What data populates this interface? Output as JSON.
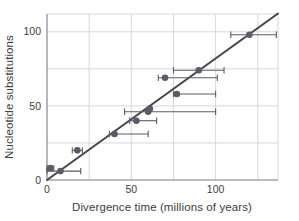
{
  "chart_data": {
    "type": "scatter",
    "title": "",
    "xlabel": "Divergence time (millions of years)",
    "ylabel": "Nucleotide substitutions",
    "xlim": [
      0,
      137
    ],
    "ylim": [
      0,
      112
    ],
    "xticks": [
      0,
      50,
      100
    ],
    "xticklabels": [
      "0",
      "50",
      "100"
    ],
    "yticks": [
      0,
      50,
      100
    ],
    "yticklabels": [
      "0",
      "50",
      "100"
    ],
    "grid": true,
    "gridlines_x": [
      0,
      25,
      50,
      75,
      100,
      125
    ],
    "gridlines_y": [
      0,
      25,
      50,
      75,
      100
    ],
    "legend": "none",
    "marker_color": "#5b5b66",
    "line_color": "#46464f",
    "grid_color": "#d4d4da",
    "axis_color": "#8a8a92",
    "errorbar_color": "#5b5b66",
    "points": [
      {
        "x": 2,
        "y": 8,
        "xerr_low": 2,
        "xerr_high": 2
      },
      {
        "x": 8,
        "y": 6,
        "xerr_low": 8,
        "xerr_high": 12
      },
      {
        "x": 18,
        "y": 20,
        "xerr_low": 3,
        "xerr_high": 3
      },
      {
        "x": 40,
        "y": 31,
        "xerr_low": 3,
        "xerr_high": 20
      },
      {
        "x": 53,
        "y": 40,
        "xerr_low": 4,
        "xerr_high": 12
      },
      {
        "x": 60,
        "y": 46,
        "xerr_low": 14,
        "xerr_high": 40
      },
      {
        "x": 61,
        "y": 48,
        "xerr_low": 1,
        "xerr_high": 1
      },
      {
        "x": 70,
        "y": 69,
        "xerr_low": 4,
        "xerr_high": 31
      },
      {
        "x": 77,
        "y": 58,
        "xerr_low": 2,
        "xerr_high": 23
      },
      {
        "x": 90,
        "y": 74,
        "xerr_low": 15,
        "xerr_high": 15
      },
      {
        "x": 120,
        "y": 98,
        "xerr_low": 11,
        "xerr_high": 16
      }
    ],
    "fit_line": {
      "slope": 0.82,
      "intercept": 0,
      "x_start": 0,
      "x_end": 137
    }
  },
  "axes": {
    "x_title": "Divergence time (millions of years)",
    "y_title": "Nucleotide substitutions",
    "x_tick_0": "0",
    "x_tick_1": "50",
    "x_tick_2": "100",
    "y_tick_0": "0",
    "y_tick_1": "50",
    "y_tick_2": "100"
  }
}
